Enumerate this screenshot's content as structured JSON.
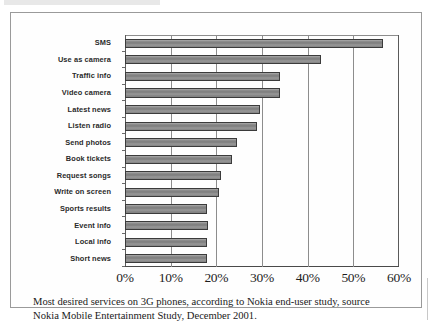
{
  "figure": {
    "caption_line1": "Most desired services on 3G phones, according to Nokia end-user study, source",
    "caption_line2": "Nokia Mobile Entertainment Study, December 2001."
  },
  "chart_data": {
    "type": "bar",
    "orientation": "horizontal",
    "title": "",
    "xlabel": "",
    "ylabel": "",
    "xlim": [
      0,
      60
    ],
    "xticks": [
      0,
      10,
      20,
      30,
      40,
      50,
      60
    ],
    "xtick_labels": [
      "0%",
      "10%",
      "20%",
      "30%",
      "40%",
      "50%",
      "60%"
    ],
    "grid": true,
    "grid_axis": "x",
    "legend": false,
    "bar_color": "#8a8a8a",
    "bar_edge_color": "#3b3b3b",
    "categories": [
      "SMS",
      "Use as camera",
      "Traffic info",
      "Video camera",
      "Latest news",
      "Listen radio",
      "Send photos",
      "Book tickets",
      "Request songs",
      "Write on screen",
      "Sports results",
      "Event info",
      "Local info",
      "Short news"
    ],
    "values": [
      56.5,
      43,
      34,
      34,
      29.5,
      29,
      24.5,
      23.5,
      21,
      20.5,
      18,
      18.2,
      18,
      18
    ],
    "value_unit": "%"
  }
}
